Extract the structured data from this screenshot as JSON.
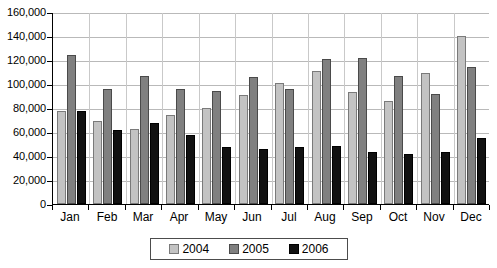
{
  "chart_data": {
    "type": "bar",
    "title": "",
    "subtitle": "",
    "xlabel": "",
    "ylabel": "",
    "categories": [
      "Jan",
      "Feb",
      "Mar",
      "Apr",
      "May",
      "Jun",
      "Jul",
      "Aug",
      "Sep",
      "Oct",
      "Nov",
      "Dec"
    ],
    "series": [
      {
        "name": "2004",
        "color": "#c3c3c3",
        "values": [
          77500,
          69000,
          62500,
          74000,
          80000,
          90500,
          100500,
          110500,
          93000,
          86000,
          109000,
          140000
        ]
      },
      {
        "name": "2005",
        "color": "#808080",
        "values": [
          124500,
          96000,
          106500,
          95500,
          94000,
          105500,
          95500,
          121000,
          122000,
          106500,
          91500,
          114000
        ]
      },
      {
        "name": "2006",
        "color": "#111111",
        "values": [
          77500,
          61500,
          67500,
          57500,
          47500,
          46000,
          47500,
          48500,
          43000,
          42000,
          43500,
          55000
        ]
      }
    ],
    "ylim": [
      0,
      160000
    ],
    "ytick_step": 20000,
    "ytick_labels": [
      "0",
      "20,000",
      "40,000",
      "60,000",
      "80,000",
      "100,000",
      "120,000",
      "140,000",
      "160,000"
    ],
    "ytick_values": [
      0,
      20000,
      40000,
      60000,
      80000,
      100000,
      120000,
      140000,
      160000
    ],
    "grid": {
      "horizontal": true,
      "vertical": true
    },
    "legend": {
      "position": "bottom",
      "entries": [
        {
          "label": "2004",
          "color": "#c3c3c3"
        },
        {
          "label": "2005",
          "color": "#808080"
        },
        {
          "label": "2006",
          "color": "#111111"
        }
      ]
    }
  }
}
